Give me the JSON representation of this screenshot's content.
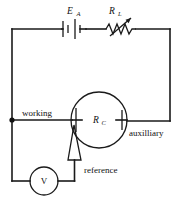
{
  "figure": {
    "type": "circuit-schematic",
    "background_color": "#ffffff",
    "line_color": "#1a1a1a"
  },
  "labels": {
    "source_symbol": "E",
    "source_subscript": "A",
    "resistor_symbol": "R",
    "resistor_subscript": "L",
    "cell_symbol": "R",
    "cell_subscript": "C",
    "working_electrode": "working",
    "auxiliary_electrode": "auxilliary",
    "reference_electrode": "reference",
    "voltmeter": "V"
  },
  "components": [
    {
      "name": "battery",
      "label": "E_A",
      "kind": "dc-voltage-source",
      "plates": 4,
      "position": "top-left-branch"
    },
    {
      "name": "variable-resistor",
      "label": "R_L",
      "kind": "rheostat",
      "has_arrow": true,
      "position": "top-right-branch"
    },
    {
      "name": "electrochemical-cell",
      "label": "R_C",
      "kind": "cell",
      "electrodes": [
        "working",
        "reference",
        "auxilliary"
      ],
      "position": "center"
    },
    {
      "name": "voltmeter",
      "label": "V",
      "kind": "meter",
      "position": "bottom-left"
    }
  ],
  "nodes": [
    {
      "name": "working-junction",
      "x": 12,
      "y": 120
    }
  ]
}
